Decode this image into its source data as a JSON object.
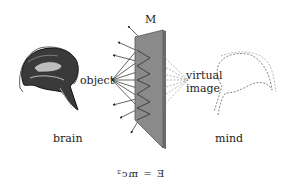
{
  "diagram": {
    "mirror_label": "M",
    "object_label": "object",
    "virtual_label": "virtual",
    "image_label": "image",
    "brain_caption": "brain",
    "mind_caption": "mind",
    "equation": "E  =  mc²",
    "equation_note": "rendered mirror-reversed",
    "colors": {
      "mirror_face": "#8a8a8a",
      "mirror_edge": "#555555",
      "ray": "#222222",
      "virtual_ray": "#888888",
      "text": "#222222"
    }
  }
}
